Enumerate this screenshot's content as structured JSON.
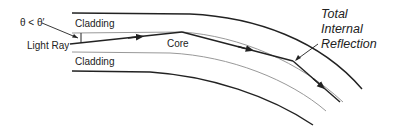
{
  "diagram": {
    "labels": {
      "angle": "θ < θ′",
      "light_ray": "Light Ray",
      "cladding_top": "Cladding",
      "core": "Core",
      "cladding_bottom": "Cladding",
      "tir_line1": "Total",
      "tir_line2": "Internal",
      "tir_line3": "Reflection"
    },
    "colors": {
      "outer_boundary": "#222222",
      "interface": "#999999",
      "ray": "#222222",
      "text": "#222222",
      "background": "#ffffff"
    }
  }
}
